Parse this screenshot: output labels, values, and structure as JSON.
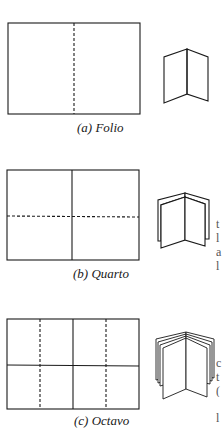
{
  "figure": {
    "panels": [
      {
        "id": "a",
        "caption": "(a) Folio",
        "sheet": {
          "x": 8,
          "y": 23,
          "w": 132,
          "h": 91
        },
        "solid_folds": [],
        "dashed_folds": [
          {
            "x1": 74,
            "y1": 23,
            "x2": 74,
            "y2": 114
          }
        ],
        "book_layers": 1
      },
      {
        "id": "b",
        "caption": "(b) Quarto",
        "sheet": {
          "x": 7,
          "y": 170,
          "w": 132,
          "h": 90
        },
        "solid_folds": [
          {
            "x1": 72,
            "y1": 170,
            "x2": 72,
            "y2": 260
          }
        ],
        "dashed_folds": [
          {
            "x1": 7,
            "y1": 216,
            "x2": 139,
            "y2": 217
          }
        ],
        "book_layers": 2
      },
      {
        "id": "c",
        "caption": "(c) Octavo",
        "sheet": {
          "x": 7,
          "y": 319,
          "w": 132,
          "h": 90
        },
        "solid_folds": [
          {
            "x1": 73,
            "y1": 319,
            "x2": 73,
            "y2": 409
          },
          {
            "x1": 7,
            "y1": 365,
            "x2": 139,
            "y2": 366
          }
        ],
        "dashed_folds": [
          {
            "x1": 40,
            "y1": 319,
            "x2": 40,
            "y2": 409
          },
          {
            "x1": 106,
            "y1": 319,
            "x2": 106,
            "y2": 409
          }
        ],
        "book_layers": 4
      }
    ],
    "stroke_color": "#1a1a1a"
  },
  "edge_fragments": [
    "t",
    "l",
    "a",
    "l",
    "c",
    "t",
    "(",
    "l"
  ]
}
